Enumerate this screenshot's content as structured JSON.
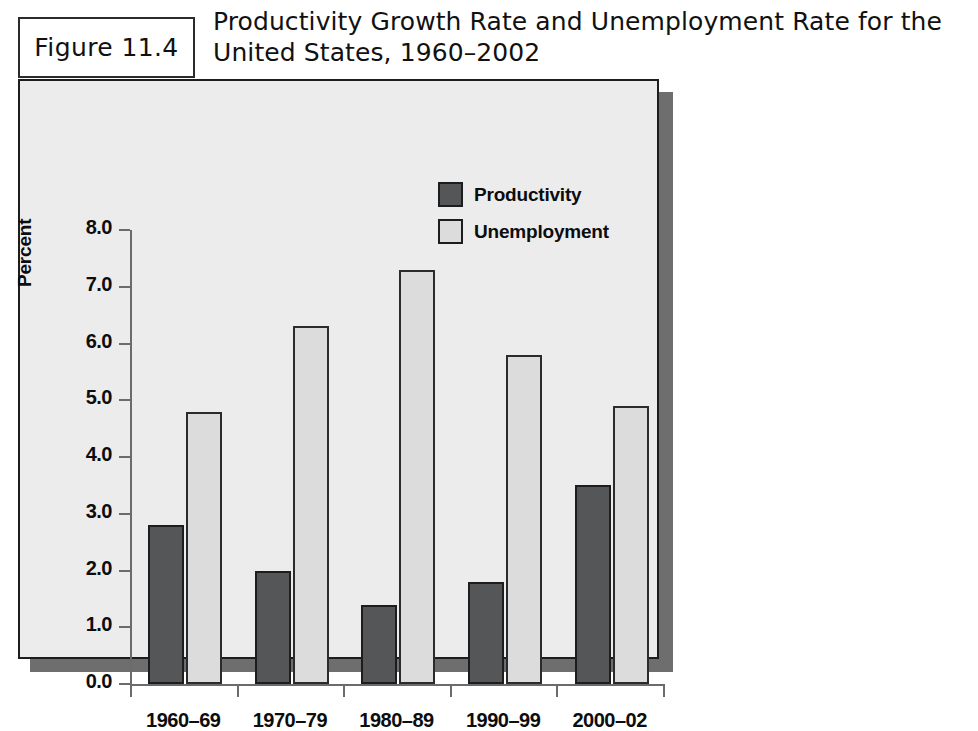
{
  "figure": {
    "label": "Figure 11.4",
    "title": "Productivity Growth Rate and Unemployment Rate for the United States, 1960–2002"
  },
  "chart_data": {
    "type": "bar",
    "title": "Productivity Growth Rate and Unemployment Rate for the United States, 1960–2002",
    "xlabel": "",
    "ylabel": "Percent",
    "categories": [
      "1960–69",
      "1970–79",
      "1980–89",
      "1990–99",
      "2000–02"
    ],
    "series": [
      {
        "name": "Productivity",
        "color": "#555658",
        "values": [
          2.8,
          2.0,
          1.4,
          1.8,
          3.5
        ]
      },
      {
        "name": "Unemployment",
        "color": "#dcdcdd",
        "values": [
          4.8,
          6.3,
          7.3,
          5.8,
          4.9
        ]
      }
    ],
    "ylim": [
      0.0,
      8.0
    ],
    "ytick_labels": [
      "8.0",
      "7.0",
      "6.0",
      "5.0",
      "4.0",
      "3.0",
      "2.0",
      "1.0",
      "0.0"
    ],
    "ytick_values": [
      8.0,
      7.0,
      6.0,
      5.0,
      4.0,
      3.0,
      2.0,
      1.0,
      0.0
    ],
    "grid": false,
    "legend_position": "top-right"
  }
}
